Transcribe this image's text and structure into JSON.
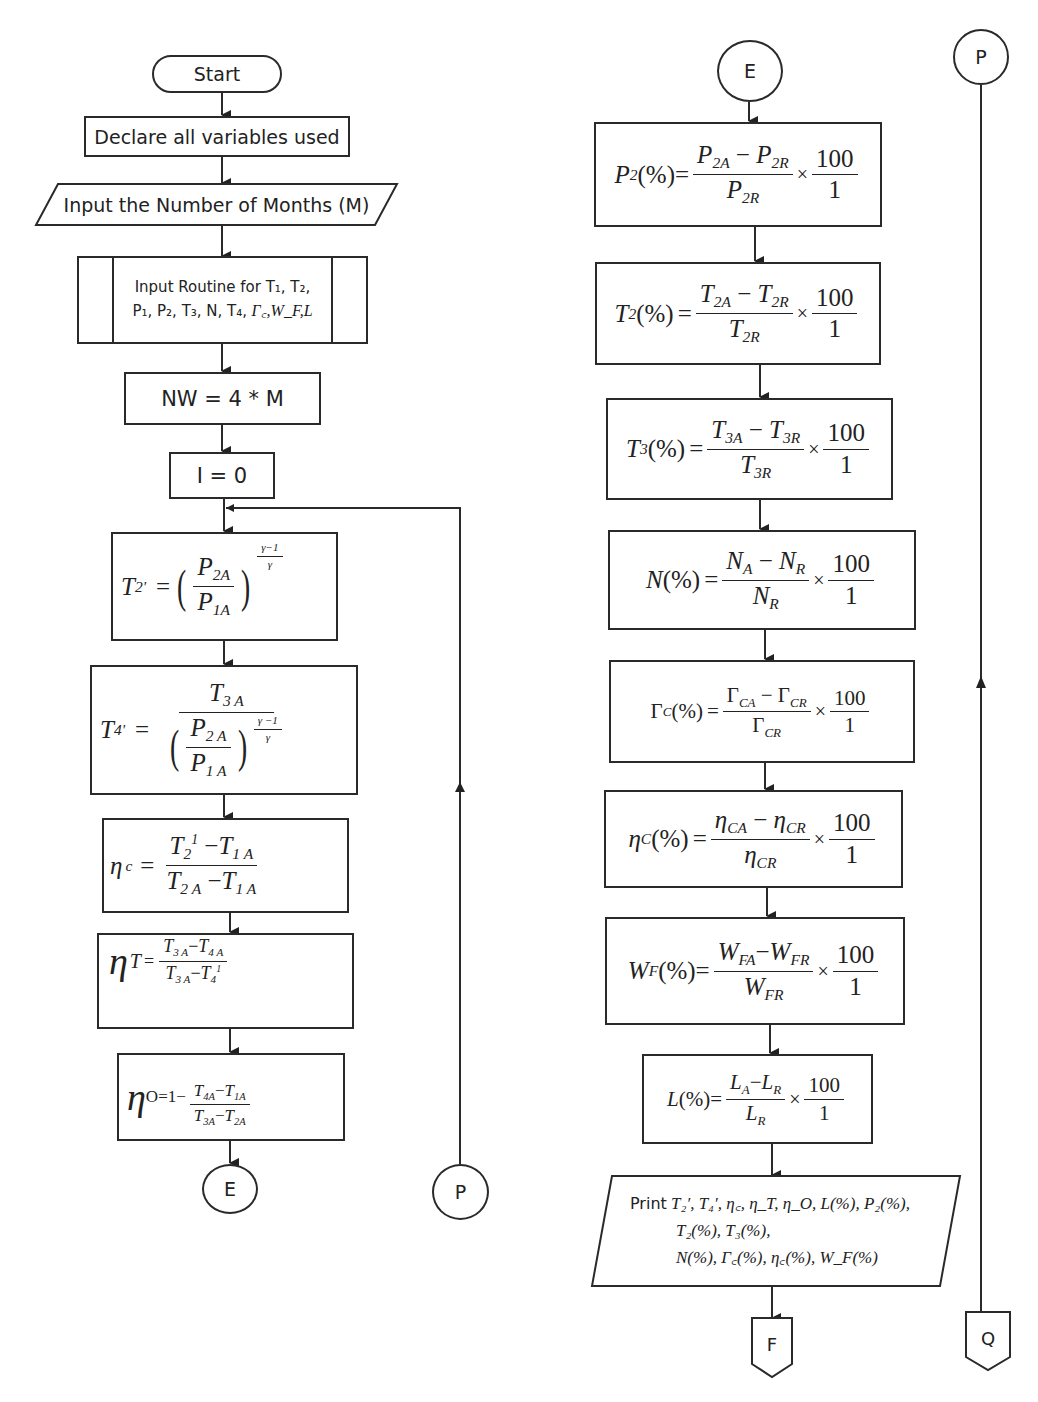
{
  "diagram": {
    "type": "flowchart",
    "left_column": {
      "start": "Start",
      "declare": "Declare all variables used",
      "input_months": "Input the Number of Months (M)",
      "input_routine_line1": "Input Routine for T₁, T₂,",
      "input_routine_line2_prefix": "P₁, P₂, T₃, N, T₄,",
      "input_routine_line2_math": "Γ꜀,W_F,L",
      "nw": "NW = 4 * M",
      "init_i": "I = 0",
      "t2prime": {
        "lhs": "T",
        "lhs_sub": "2'",
        "eq": "=",
        "num": "P",
        "num_sub": "2A",
        "den": "P",
        "den_sub": "1A",
        "exp_num": "γ−1",
        "exp_den": "γ"
      },
      "t4prime": {
        "lhs": "T",
        "lhs_sub": "4'",
        "eq": "=",
        "top": "T",
        "top_sub": "3 A",
        "num": "P",
        "num_sub": "2 A",
        "den": "P",
        "den_sub": "1 A",
        "exp_num": "γ −1",
        "exp_den": "γ"
      },
      "eta_c": {
        "lhs": "η",
        "lhs_sub": "c",
        "eq": "=",
        "num_a": "T",
        "num_a_sub": "2",
        "num_a_sup": "1",
        "num_b": "T",
        "num_b_sub": "1 A",
        "den_a": "T",
        "den_a_sub": "2 A",
        "den_b": "T",
        "den_b_sub": "1 A"
      },
      "eta_t": {
        "lhs": "η",
        "lhs_sub": "T",
        "eq": "=",
        "num_a": "T",
        "num_a_sub": "3 A",
        "num_b": "T",
        "num_b_sub": "4 A",
        "den_a": "T",
        "den_a_sub": "3 A",
        "den_b": "T",
        "den_b_sub": "4",
        "den_b_sup": "1"
      },
      "eta_o": {
        "lhs": "η",
        "lhs_sub": "O=1−",
        "num_a": "T",
        "num_a_sub": "4A",
        "num_b": "T",
        "num_b_sub": "1A",
        "den_a": "T",
        "den_a_sub": "3A",
        "den_b": "T",
        "den_b_sub": "2A"
      },
      "connector_e": "E",
      "connector_p": "P"
    },
    "right_column": {
      "connector_e": "E",
      "formulas": [
        {
          "id": "p2",
          "lhs": "P",
          "lhs_sub": "2",
          "pct": "(%)",
          "num_a": "P",
          "num_a_sub": "2A",
          "num_b": "P",
          "num_b_sub": "2R",
          "den": "P",
          "den_sub": "2R",
          "times": "×",
          "k_num": "100",
          "k_den": "1"
        },
        {
          "id": "t2",
          "lhs": "T",
          "lhs_sub": "2",
          "pct": "(%)",
          "num_a": "T",
          "num_a_sub": "2A",
          "num_b": "T",
          "num_b_sub": "2R",
          "den": "T",
          "den_sub": "2R",
          "times": "×",
          "k_num": "100",
          "k_den": "1"
        },
        {
          "id": "t3",
          "lhs": "T",
          "lhs_sub": "3",
          "pct": "(%)",
          "num_a": "T",
          "num_a_sub": "3A",
          "num_b": "T",
          "num_b_sub": "3R",
          "den": "T",
          "den_sub": "3R",
          "times": "×",
          "k_num": "100",
          "k_den": "1"
        },
        {
          "id": "n",
          "lhs": "N",
          "lhs_sub": "",
          "pct": "(%)",
          "num_a": "N",
          "num_a_sub": "A",
          "num_b": "N",
          "num_b_sub": "R",
          "den": "N",
          "den_sub": "R",
          "times": "×",
          "k_num": "100",
          "k_den": "1"
        },
        {
          "id": "gc",
          "lhs": "Γ",
          "lhs_sub": "C",
          "pct": "(%)",
          "num_a": "Γ",
          "num_a_sub": "CA",
          "num_b": "Γ",
          "num_b_sub": "CR",
          "den": "Γ",
          "den_sub": "CR",
          "times": "×",
          "k_num": "100",
          "k_den": "1"
        },
        {
          "id": "ec",
          "lhs": "η",
          "lhs_sub": "C",
          "pct": "(%)",
          "num_a": "η",
          "num_a_sub": "CA",
          "num_b": "η",
          "num_b_sub": "CR",
          "den": "η",
          "den_sub": "CR",
          "times": "×",
          "k_num": "100",
          "k_den": "1"
        },
        {
          "id": "wf",
          "lhs": "W",
          "lhs_sub": "F",
          "pct": "(%)",
          "num_a": "W",
          "num_a_sub": "FA",
          "num_b": "W",
          "num_b_sub": "FR",
          "den": "W",
          "den_sub": "FR",
          "times": "×",
          "k_num": "100",
          "k_den": "1"
        },
        {
          "id": "l",
          "lhs": "L",
          "lhs_sub": "",
          "pct": "(%)",
          "num_a": "L",
          "num_a_sub": "A",
          "num_b": "L",
          "num_b_sub": "R",
          "den": "L",
          "den_sub": "R",
          "times": "×",
          "k_num": "100",
          "k_den": "1"
        }
      ],
      "print": {
        "word": "Print",
        "line1": "T₂′, T₄′, η꜀, η_T, η_O, L(%), P₂(%),",
        "line2": "T₂(%), T₃(%),",
        "line3": "N(%), Γ꜀(%), η꜀(%), W_F(%)"
      },
      "offpage_f": "F"
    },
    "far_right": {
      "connector_p": "P",
      "offpage_q": "Q"
    },
    "minus": "−"
  }
}
